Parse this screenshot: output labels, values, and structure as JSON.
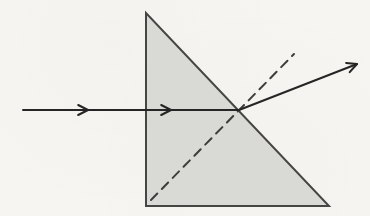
{
  "canvas": {
    "width": 370,
    "height": 216,
    "background": "#f6f5f2"
  },
  "prism": {
    "shape": "right-triangle",
    "vertices": [
      [
        146,
        13
      ],
      [
        146,
        206
      ],
      [
        329,
        206
      ]
    ],
    "fill": "#d9d9d6",
    "stroke": "#454543",
    "stroke_width": 2
  },
  "incident_ray": {
    "from": [
      23,
      110
    ],
    "to": [
      239,
      110
    ],
    "color": "#252525",
    "width": 2,
    "arrowheads": [
      {
        "tip": [
          88,
          110
        ],
        "direction_deg": 0
      },
      {
        "tip": [
          171,
          110
        ],
        "direction_deg": 0
      }
    ]
  },
  "refracted_ray": {
    "from": [
      239,
      110
    ],
    "to": [
      357,
      64
    ],
    "color": "#252525",
    "width": 2,
    "arrowheads": [
      {
        "tip": [
          357,
          64
        ],
        "direction_deg": -21.3
      }
    ]
  },
  "normal_line": {
    "from": [
      151,
      200
    ],
    "to": [
      294,
      54
    ],
    "color": "#3d3d3b",
    "width": 2,
    "dash": "9 6.5"
  },
  "arrow_style": {
    "length": 11,
    "half_angle_deg": 27
  }
}
